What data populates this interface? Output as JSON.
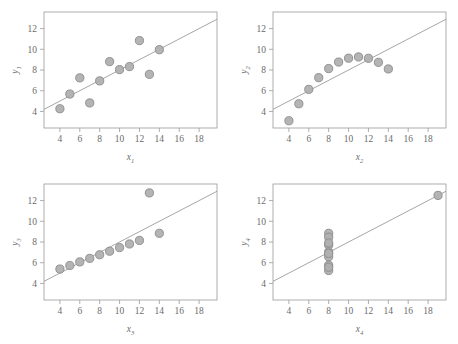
{
  "figure": {
    "caption": "",
    "panel_count": 4,
    "marker_fill": "#b0b0b0",
    "marker_stroke": "#8a8a8a",
    "line_color": "#8f8f8f",
    "frame_color": "#9a9a9a",
    "text_color": "#6b6b6b",
    "background": "#ffffff"
  },
  "axes": {
    "x_ticks": [
      4,
      6,
      8,
      10,
      12,
      14,
      16,
      18
    ],
    "y_ticks": [
      4,
      6,
      8,
      10,
      12
    ],
    "xlim": [
      2.4,
      19.8
    ],
    "ylim": [
      2.4,
      13.6
    ],
    "grid": false
  },
  "chart_data": [
    {
      "type": "scatter",
      "title": "",
      "xlabel": "x1",
      "ylabel": "y1",
      "xlabel_base": "x",
      "xlabel_sub": "1",
      "ylabel_base": "y",
      "ylabel_sub": "1",
      "x": [
        10,
        8,
        13,
        9,
        11,
        14,
        6,
        4,
        12,
        7,
        5
      ],
      "y": [
        8.04,
        6.95,
        7.58,
        8.81,
        8.33,
        9.96,
        7.24,
        4.26,
        10.84,
        4.82,
        5.68
      ],
      "xlim": [
        2.4,
        19.8
      ],
      "ylim": [
        2.4,
        13.6
      ],
      "xticks": [
        4,
        6,
        8,
        10,
        12,
        14,
        16,
        18
      ],
      "yticks": [
        4,
        6,
        8,
        10,
        12
      ],
      "fit": {
        "slope": 0.5,
        "intercept": 3.0,
        "x_start": 2.4,
        "x_end": 19.8
      },
      "legend": null,
      "grid": false
    },
    {
      "type": "scatter",
      "title": "",
      "xlabel": "x2",
      "ylabel": "y2",
      "xlabel_base": "x",
      "xlabel_sub": "2",
      "ylabel_base": "y",
      "ylabel_sub": "2",
      "x": [
        10,
        8,
        13,
        9,
        11,
        14,
        6,
        4,
        12,
        7,
        5
      ],
      "y": [
        9.14,
        8.14,
        8.74,
        8.77,
        9.26,
        8.1,
        6.13,
        3.1,
        9.13,
        7.26,
        4.74
      ],
      "xlim": [
        2.4,
        19.8
      ],
      "ylim": [
        2.4,
        13.6
      ],
      "xticks": [
        4,
        6,
        8,
        10,
        12,
        14,
        16,
        18
      ],
      "yticks": [
        4,
        6,
        8,
        10,
        12
      ],
      "fit": {
        "slope": 0.5,
        "intercept": 3.0,
        "x_start": 2.4,
        "x_end": 19.8
      },
      "legend": null,
      "grid": false
    },
    {
      "type": "scatter",
      "title": "",
      "xlabel": "x3",
      "ylabel": "y3",
      "xlabel_base": "x",
      "xlabel_sub": "3",
      "ylabel_base": "y",
      "ylabel_sub": "3",
      "x": [
        10,
        8,
        13,
        9,
        11,
        14,
        6,
        4,
        12,
        7,
        5
      ],
      "y": [
        7.46,
        6.77,
        12.74,
        7.11,
        7.81,
        8.84,
        6.08,
        5.39,
        8.15,
        6.42,
        5.73
      ],
      "xlim": [
        2.4,
        19.8
      ],
      "ylim": [
        2.4,
        13.6
      ],
      "xticks": [
        4,
        6,
        8,
        10,
        12,
        14,
        16,
        18
      ],
      "yticks": [
        4,
        6,
        8,
        10,
        12
      ],
      "fit": {
        "slope": 0.5,
        "intercept": 3.0,
        "x_start": 2.4,
        "x_end": 19.8
      },
      "legend": null,
      "grid": false
    },
    {
      "type": "scatter",
      "title": "",
      "xlabel": "x4",
      "ylabel": "y4",
      "xlabel_base": "x",
      "xlabel_sub": "4",
      "ylabel_base": "y",
      "ylabel_sub": "4",
      "x": [
        8,
        8,
        8,
        8,
        8,
        8,
        8,
        19,
        8,
        8,
        8
      ],
      "y": [
        6.58,
        5.76,
        7.71,
        8.84,
        8.47,
        7.04,
        5.25,
        12.5,
        5.56,
        7.91,
        6.89
      ],
      "xlim": [
        2.4,
        19.8
      ],
      "ylim": [
        2.4,
        13.6
      ],
      "xticks": [
        4,
        6,
        8,
        10,
        12,
        14,
        16,
        18
      ],
      "yticks": [
        4,
        6,
        8,
        10,
        12
      ],
      "fit": {
        "slope": 0.5,
        "intercept": 3.0,
        "x_start": 2.4,
        "x_end": 19.8
      },
      "legend": null,
      "grid": false
    }
  ]
}
